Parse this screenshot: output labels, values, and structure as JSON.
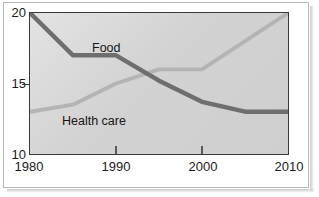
{
  "chart_data": {
    "type": "line",
    "title": "",
    "xlabel": "",
    "ylabel": "",
    "xlim": [
      1980,
      2010
    ],
    "ylim": [
      10,
      20
    ],
    "x_ticks": [
      1980,
      1990,
      2000,
      2010
    ],
    "x_tick_labels": [
      "1980",
      "1990",
      "2000",
      "2010"
    ],
    "y_ticks": [
      10,
      15,
      20
    ],
    "y_tick_labels": [
      "10",
      "15",
      "20"
    ],
    "grid": false,
    "legend_position": "inline-annotations",
    "series": [
      {
        "name": "Food",
        "color": "#6e6e6e",
        "x": [
          1980,
          1985,
          1990,
          1995,
          2000,
          2005,
          2010
        ],
        "values": [
          20.0,
          17.0,
          17.0,
          15.2,
          13.7,
          13.0,
          13.0
        ]
      },
      {
        "name": "Health care",
        "color": "#b4b4b4",
        "x": [
          1980,
          1985,
          1990,
          1995,
          2000,
          2005,
          2010
        ],
        "values": [
          13.0,
          13.5,
          15.0,
          16.0,
          16.0,
          18.0,
          20.0
        ]
      }
    ],
    "annotations": [
      {
        "text": "Food",
        "series": "Food"
      },
      {
        "text": "Health care",
        "series": "Health care"
      }
    ]
  },
  "axes": {
    "y": {
      "tick_20": "20",
      "tick_15": "15",
      "tick_10": "10"
    },
    "x": {
      "tick_1980": "1980",
      "tick_1990": "1990",
      "tick_2000": "2000",
      "tick_2010": "2010"
    }
  },
  "labels": {
    "food": "Food",
    "health_care": "Health care"
  },
  "colors": {
    "food_line": "#6e6e6e",
    "health_care_line": "#b4b4b4",
    "axis": "#3a3a3a",
    "plot_background": "#d6d6d6",
    "text": "#1a1a1a"
  }
}
